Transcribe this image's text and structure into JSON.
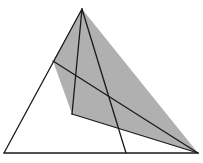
{
  "figure": {
    "width": 203,
    "height": 163,
    "colors": {
      "background": "#ffffff",
      "stroke": "#1a1a1a",
      "shade": "#b0b0b0"
    },
    "points": {
      "A": [
        82,
        9
      ],
      "B": [
        4,
        153
      ],
      "C": [
        126,
        153
      ],
      "D": [
        198,
        153
      ],
      "E": [
        53,
        61
      ],
      "F": [
        72,
        114
      ]
    },
    "shaded_polygons": [
      "82,9 53,61 72,114 198,153"
    ],
    "segments": [
      "82,9 4,153",
      "82,9 126,153",
      "4,153 198,153",
      "53,61 198,153",
      "82,9 72,114",
      "72,114 198,153"
    ]
  }
}
